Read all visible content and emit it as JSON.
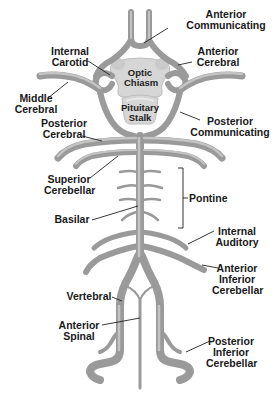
{
  "diagram": {
    "colors": {
      "vessel": "#9a9a9a",
      "vessel_highlight": "#c4c4c4",
      "structure_fill": "#d6d6d6",
      "label_text": "#1a1a1a",
      "background": "#ffffff"
    },
    "structures": {
      "optic_chiasm": [
        "Optic",
        "Chiasm"
      ],
      "pituitary_stalk": [
        "Pituitary",
        "Stalk"
      ]
    },
    "labels": {
      "anterior_communicating": [
        "Anterior",
        "Communicating"
      ],
      "internal_carotid": [
        "Internal",
        "Carotid"
      ],
      "anterior_cerebral": [
        "Anterior",
        "Cerebral"
      ],
      "middle_cerebral": [
        "Middle",
        "Cerebral"
      ],
      "posterior_communicating": [
        "Posterior",
        "Communicating"
      ],
      "posterior_cerebral": [
        "Posterior",
        "Cerebral"
      ],
      "superior_cerebellar": [
        "Superior",
        "Cerebellar"
      ],
      "pontine": [
        "Pontine"
      ],
      "basilar": [
        "Basilar"
      ],
      "internal_auditory": [
        "Internal",
        "Auditory"
      ],
      "anterior_inferior_cerebellar": [
        "Anterior",
        "Inferior",
        "Cerebellar"
      ],
      "vertebral": [
        "Vertebral"
      ],
      "anterior_spinal": [
        "Anterior",
        "Spinal"
      ],
      "posterior_inferior_cerebellar": [
        "Posterior",
        "Inferior",
        "Cerebellar"
      ]
    }
  }
}
